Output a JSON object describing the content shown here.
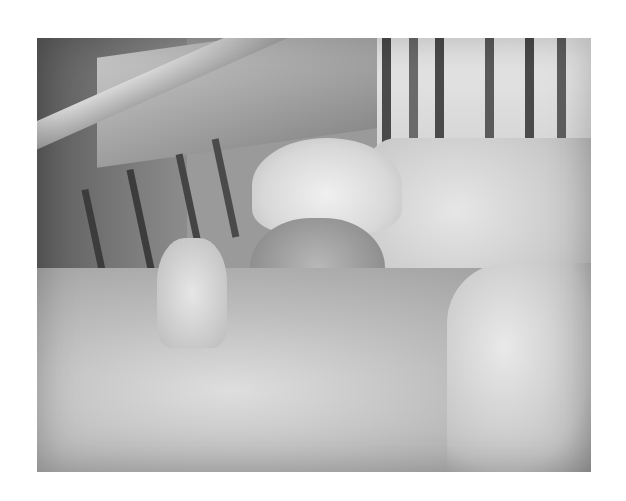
{
  "image": {
    "description": "Grayscale photograph of an infant in a hospital crib wearing a knitted hat and a breathing mask, covered with white blankets",
    "style": "black-and-white photo",
    "frame": {
      "left": 37,
      "top": 38,
      "width": 554,
      "height": 434
    },
    "background_color": "#ffffff",
    "subjects": [
      "infant",
      "knitted hat",
      "breathing mask with tube",
      "mask straps",
      "crib rails",
      "white blanket",
      "pillow",
      "shelf"
    ],
    "palette": {
      "light": "#e8e8e8",
      "mid": "#a5a5a5",
      "dark": "#3a3a3a"
    }
  }
}
